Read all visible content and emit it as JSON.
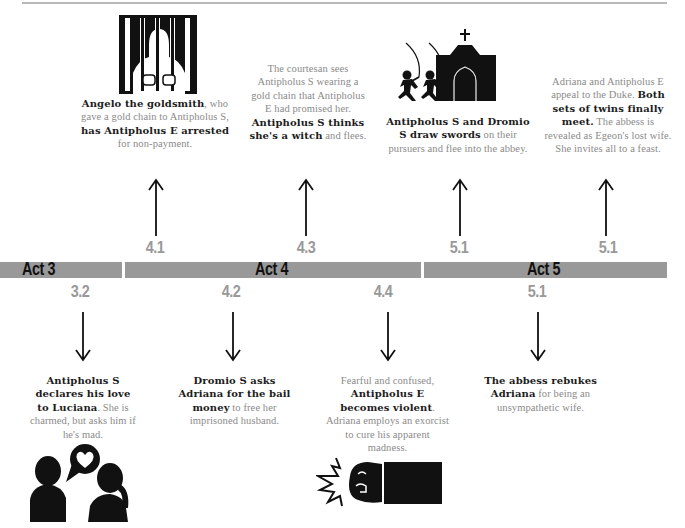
{
  "timeline": {
    "acts": [
      {
        "label": "Act 3"
      },
      {
        "label": "Act 4"
      },
      {
        "label": "Act 5"
      }
    ],
    "above": [
      {
        "scene": "4.1",
        "icon": "prisoner-behind-bars-icon",
        "parts": [
          {
            "t": "Angelo the goldsmith",
            "b": true
          },
          {
            "t": ", who gave a gold chain to Antipholus S, ",
            "b": false
          },
          {
            "t": "has Antipholus E arrested",
            "b": true
          },
          {
            "t": " for non-payment.",
            "b": false
          }
        ]
      },
      {
        "scene": "4.3",
        "icon": "",
        "parts": [
          {
            "t": "The courtesan sees Antipholus S wearing a gold chain that Antipholus E had promised her. ",
            "b": false
          },
          {
            "t": "Antipholus S thinks she's a witch",
            "b": true
          },
          {
            "t": " and flees.",
            "b": false
          }
        ]
      },
      {
        "scene": "5.1",
        "icon": "swordsmen-and-abbey-icon",
        "parts": [
          {
            "t": "Antipholus S and Dromio S draw swords",
            "b": true
          },
          {
            "t": " on their pursuers and flee into the abbey.",
            "b": false
          }
        ]
      },
      {
        "scene": "5.1",
        "icon": "",
        "parts": [
          {
            "t": "Adriana and Antipholus E appeal to the Duke. ",
            "b": false
          },
          {
            "t": "Both sets of twins finally meet.",
            "b": true
          },
          {
            "t": " The abbess is revealed as Egeon's lost wife. She invites all to a feast.",
            "b": false
          }
        ]
      }
    ],
    "below": [
      {
        "scene": "3.2",
        "icon": "couple-heart-speech-icon",
        "parts": [
          {
            "t": "Antipholus S declares his love to Luciana",
            "b": true
          },
          {
            "t": ". She is charmed, but asks him if he's mad.",
            "b": false
          }
        ]
      },
      {
        "scene": "4.2",
        "icon": "",
        "parts": [
          {
            "t": "Dromio S asks Adriana for the bail money",
            "b": true
          },
          {
            "t": " to free her imprisoned husband.",
            "b": false
          }
        ]
      },
      {
        "scene": "4.4",
        "icon": "punching-fist-icon",
        "parts": [
          {
            "t": "Fearful and confused, ",
            "b": false
          },
          {
            "t": "Antipholus E becomes violent",
            "b": true
          },
          {
            "t": ". Adriana employs an exorcist to cure his apparent madness.",
            "b": false
          }
        ]
      },
      {
        "scene": "5.1",
        "icon": "",
        "parts": [
          {
            "t": "The abbess rebukes Adriana",
            "b": true
          },
          {
            "t": " for being an unsympathetic wife.",
            "b": false
          }
        ]
      }
    ]
  },
  "colors": {
    "bar": "#999999",
    "scene_number": "#999999",
    "bold_text": "#1c1c1c",
    "regular_text": "#8a8a8a"
  }
}
